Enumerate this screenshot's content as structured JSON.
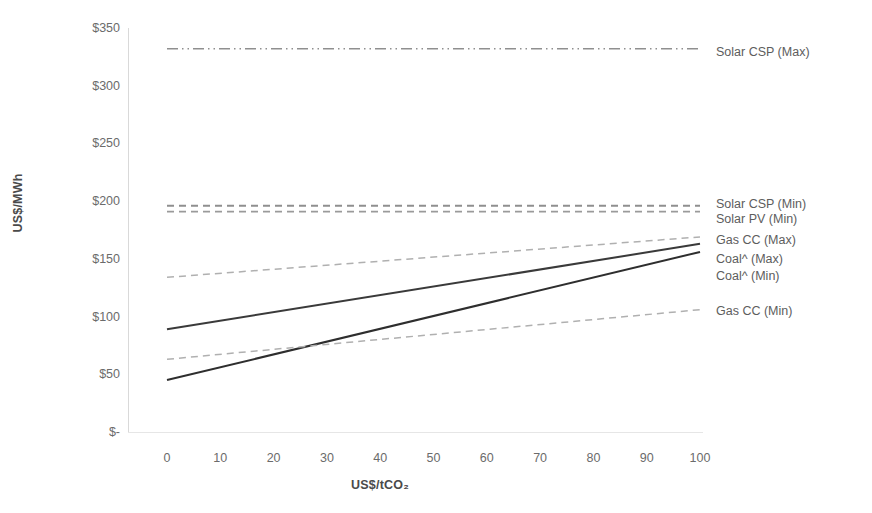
{
  "chart_data": {
    "type": "line",
    "title": "",
    "xlabel": "US$/tCO₂",
    "ylabel": "US$/MWh",
    "xlim": [
      0,
      100
    ],
    "ylim": [
      0,
      350
    ],
    "grid": false,
    "legend_position": "right-inline",
    "x": [
      0,
      100
    ],
    "xticklabels": [
      "0",
      "10",
      "20",
      "30",
      "40",
      "50",
      "60",
      "70",
      "80",
      "90",
      "100"
    ],
    "yticklabels": [
      "$350",
      "$300",
      "$250",
      "$200",
      "$150",
      "$100",
      "$50",
      "$-"
    ],
    "ytickvalues": [
      350,
      300,
      250,
      200,
      150,
      100,
      50,
      0
    ],
    "series": [
      {
        "name": "Solar CSP (Max)",
        "values": [
          332,
          332
        ],
        "style": "dashdot",
        "color": "#8f8f8f",
        "width": 1.6
      },
      {
        "name": "Solar CSP (Min)",
        "values": [
          196,
          196
        ],
        "style": "dashed",
        "color": "#8f8f8f",
        "width": 1.8
      },
      {
        "name": "Solar PV (Min)",
        "values": [
          191,
          191
        ],
        "style": "dashed",
        "color": "#9a9a9a",
        "width": 1.8
      },
      {
        "name": "Gas CC (Max)",
        "values": [
          134,
          169
        ],
        "style": "dashed",
        "color": "#b0b0b0",
        "width": 1.5
      },
      {
        "name": "Coal^ (Max)",
        "values": [
          89,
          163
        ],
        "style": "solid",
        "color": "#3a3a3a",
        "width": 2.0
      },
      {
        "name": "Coal^ (Min)",
        "values": [
          45,
          156
        ],
        "style": "solid",
        "color": "#2e2e2e",
        "width": 2.0
      },
      {
        "name": "Gas CC (Min)",
        "values": [
          63,
          106
        ],
        "style": "dashed",
        "color": "#b0b0b0",
        "width": 1.5
      }
    ]
  },
  "legend": {
    "items": [
      {
        "label": "Solar CSP (Max)",
        "y": 52
      },
      {
        "label": "Solar CSP (Min)",
        "y": 204
      },
      {
        "label": "Solar PV (Min)",
        "y": 219
      },
      {
        "label": "Gas CC (Max)",
        "y": 240
      },
      {
        "label": "Coal^ (Max)",
        "y": 259
      },
      {
        "label": "Coal^ (Min)",
        "y": 276
      },
      {
        "label": "Gas CC (Min)",
        "y": 311
      }
    ]
  }
}
